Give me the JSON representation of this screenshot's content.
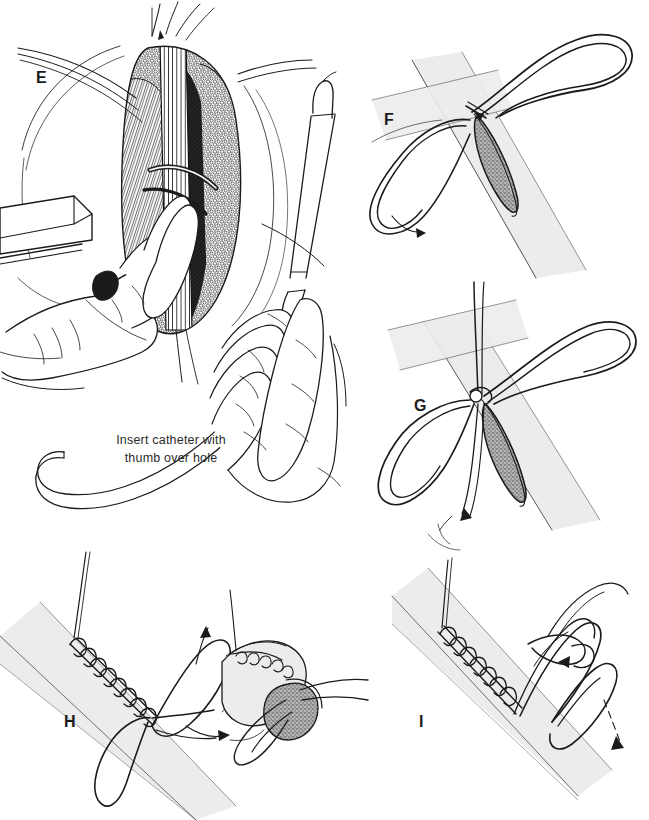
{
  "figure": {
    "background_color": "#ffffff",
    "ink_color": "#1b1b1b",
    "vessel_fill": "#ececec",
    "incision_fill": "#9a9a9a",
    "width": 649,
    "height": 820
  },
  "panels": [
    {
      "id": "E",
      "label": "E",
      "label_x": 36,
      "label_y": 70,
      "name": "panel-e-operative-field",
      "description": "Operative field with retractor and surgeon's hand steadying the exposed vessel",
      "caption": "Insert catheter with\nthumb over hole",
      "caption_x": 108,
      "caption_y": 431
    },
    {
      "id": "F",
      "label": "F",
      "label_x": 384,
      "label_y": 112,
      "name": "panel-f-arteriotomy",
      "description": "Longitudinal arteriotomy with first suture loop placed at apex"
    },
    {
      "id": "G",
      "label": "G",
      "label_x": 414,
      "label_y": 398,
      "name": "panel-g-suture-placement",
      "description": "Suture loops crossed and drawn through the arteriotomy apex"
    },
    {
      "id": "H",
      "label": "H",
      "label_x": 64,
      "label_y": 714,
      "name": "panel-h-running-closure",
      "description": "Continuous running closure of the arteriotomy with inset end-on cross section"
    },
    {
      "id": "I",
      "label": "I",
      "label_x": 419,
      "label_y": 714,
      "name": "panel-i-knot-tying",
      "description": "Completed suture line with final knot being tied"
    }
  ],
  "caption_text": {
    "line1": "Insert catheter with",
    "line2": "thumb over hole"
  }
}
